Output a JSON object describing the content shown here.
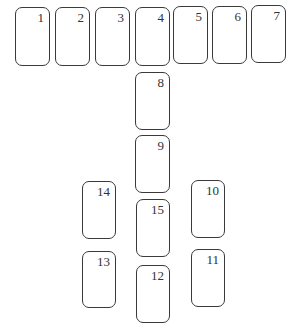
{
  "diagram": {
    "cards": [
      {
        "label": "1",
        "x": 15,
        "y": 7,
        "w": 35,
        "h": 59
      },
      {
        "label": "2",
        "x": 55,
        "y": 7,
        "w": 35,
        "h": 59
      },
      {
        "label": "3",
        "x": 95,
        "y": 7,
        "w": 35,
        "h": 59
      },
      {
        "label": "4",
        "x": 135,
        "y": 7,
        "w": 35,
        "h": 59
      },
      {
        "label": "5",
        "x": 173,
        "y": 6,
        "w": 35,
        "h": 58
      },
      {
        "label": "6",
        "x": 212,
        "y": 6,
        "w": 35,
        "h": 58
      },
      {
        "label": "7",
        "x": 251,
        "y": 5,
        "w": 35,
        "h": 58
      },
      {
        "label": "8",
        "x": 135,
        "y": 72,
        "w": 35,
        "h": 58
      },
      {
        "label": "9",
        "x": 135,
        "y": 135,
        "w": 35,
        "h": 58
      },
      {
        "label": "14",
        "x": 82,
        "y": 181,
        "w": 34,
        "h": 58
      },
      {
        "label": "10",
        "x": 191,
        "y": 180,
        "w": 34,
        "h": 58
      },
      {
        "label": "15",
        "x": 136,
        "y": 199,
        "w": 34,
        "h": 58
      },
      {
        "label": "13",
        "x": 82,
        "y": 251,
        "w": 34,
        "h": 57
      },
      {
        "label": "11",
        "x": 191,
        "y": 249,
        "w": 34,
        "h": 58
      },
      {
        "label": "12",
        "x": 136,
        "y": 265,
        "w": 34,
        "h": 58
      }
    ]
  }
}
